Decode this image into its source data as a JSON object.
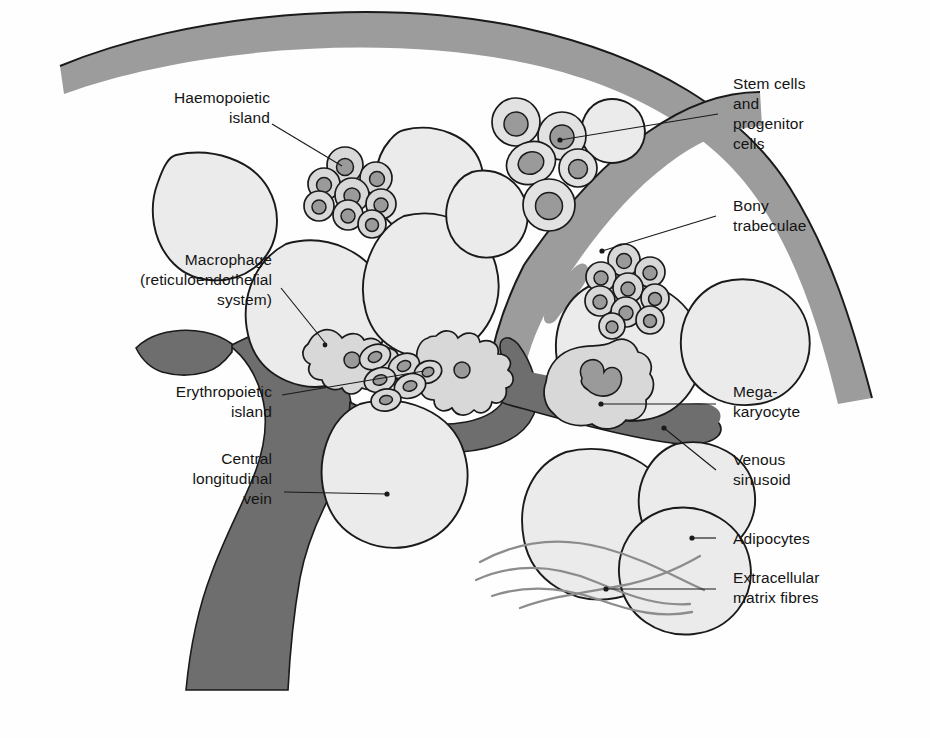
{
  "figure": {
    "kind": "anatomical-diagram",
    "background_color": "#fefefe"
  },
  "palette": {
    "vein_fill": "#6e6e6e",
    "trabeculae_fill": "#9c9c9c",
    "adipocyte_fill": "#ebebeb",
    "cell_cytoplasm": "#d8d8d8",
    "cell_nucleus": "#9a9a9a",
    "outline": "#1a1a1a",
    "fibre_stroke": "#8c8c8c",
    "leader_line": "#1a1a1a",
    "text": "#141414"
  },
  "labels": [
    {
      "id": "haemopoietic-island",
      "text": "Haemopoietic\nisland",
      "align": "right"
    },
    {
      "id": "macrophage",
      "text": "Macrophage\n(reticuloendothelial\nsystem)",
      "align": "right"
    },
    {
      "id": "erythropoietic-island",
      "text": "Erythropoietic\nisland",
      "align": "right"
    },
    {
      "id": "central-longitudinal-vein",
      "text": "Central\nlongitudinal\nvein",
      "align": "right"
    },
    {
      "id": "stem-and-progenitor-cells",
      "text": "Stem cells\nand\nprogenitor\ncells",
      "align": "left"
    },
    {
      "id": "bony-trabeculae",
      "text": "Bony\ntrabeculae",
      "align": "left"
    },
    {
      "id": "megakaryocyte",
      "text": "Mega-\nkaryocyte",
      "align": "left"
    },
    {
      "id": "venous-sinusoid",
      "text": "Venous\nsinusoid",
      "align": "left"
    },
    {
      "id": "adipocytes",
      "text": "Adipocytes",
      "align": "left"
    },
    {
      "id": "extracellular-matrix-fibres",
      "text": "Extracellular\nmatrix fibres",
      "align": "left"
    }
  ],
  "structures": {
    "bony_trabeculae_count": 2,
    "haemopoietic_island_cell_count": 8,
    "stem_cell_cluster_count": 5,
    "second_island_cell_count": 9,
    "macrophage_count": 2,
    "erythroblast_count": 6,
    "megakaryocyte_count": 1,
    "adipocyte_count": 12,
    "matrix_fibre_count": 4
  }
}
